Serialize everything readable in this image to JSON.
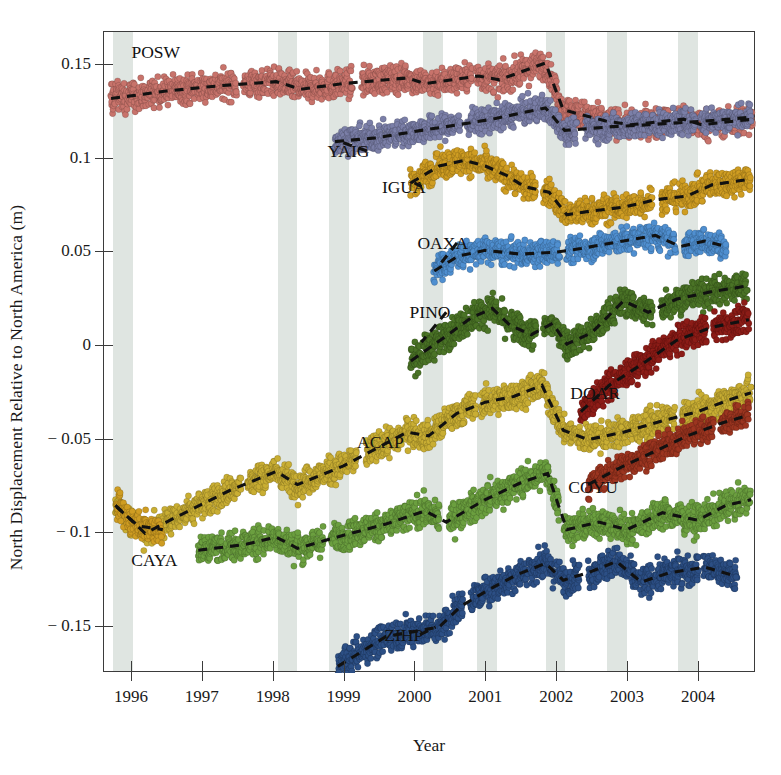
{
  "chart_data": {
    "type": "scatter",
    "title": "",
    "xlabel": "Year",
    "ylabel": "North Displacement Relative to North America (m)",
    "xlim": [
      1995.62,
      2004.82
    ],
    "ylim": [
      -0.175,
      0.167
    ],
    "grid": false,
    "legend_position": "inline-annotations",
    "xticks": [
      1996,
      1997,
      1998,
      1999,
      2000,
      2001,
      2002,
      2003,
      2004
    ],
    "xtick_labels": [
      "1996",
      "1997",
      "1998",
      "1999",
      "2000",
      "2001",
      "2002",
      "2003",
      "2004"
    ],
    "yticks": [
      0.15,
      0.1,
      0.05,
      0,
      -0.05,
      -0.1,
      -0.15
    ],
    "ytick_labels": [
      "0.15",
      "0.1",
      "0.05",
      "0",
      "− 0.05",
      "− 0.1",
      "− 0.15"
    ],
    "shaded_bands": [
      {
        "start": 1995.75,
        "end": 1996.03
      },
      {
        "start": 1998.07,
        "end": 1998.35
      },
      {
        "start": 1998.8,
        "end": 1999.08
      },
      {
        "start": 2000.12,
        "end": 2000.4
      },
      {
        "start": 2000.88,
        "end": 2001.16
      },
      {
        "start": 2001.85,
        "end": 2002.13
      },
      {
        "start": 2002.72,
        "end": 2003.0
      },
      {
        "start": 2003.72,
        "end": 2004.0
      }
    ],
    "band_color": "#d9e0dc",
    "series": [
      {
        "name": "POSW",
        "color": "#c8736b",
        "label_x": 1996.35,
        "label_y": 0.1565,
        "points_note": "dense daily scatter, gentle northward trend with slow-slip offsets",
        "trend": [
          [
            1995.72,
            0.1315
          ],
          [
            1996.5,
            0.1355
          ],
          [
            1997.3,
            0.1385
          ],
          [
            1998.05,
            0.1405
          ],
          [
            1998.4,
            0.1365
          ],
          [
            1999.0,
            0.1395
          ],
          [
            1999.9,
            0.1425
          ],
          [
            2000.15,
            0.1395
          ],
          [
            2000.9,
            0.1435
          ],
          [
            2001.2,
            0.1415
          ],
          [
            2001.85,
            0.1505
          ],
          [
            2002.1,
            0.1255
          ],
          [
            2002.7,
            0.1195
          ],
          [
            2003.05,
            0.1175
          ],
          [
            2003.8,
            0.1205
          ],
          [
            2004.05,
            0.1175
          ],
          [
            2004.78,
            0.1205
          ]
        ],
        "scatter_spread": 0.0075
      },
      {
        "name": "YAIG",
        "color": "#7b7fa8",
        "label_x": 1999.07,
        "label_y": 0.1035,
        "trend": [
          [
            1998.88,
            0.1085
          ],
          [
            1999.45,
            0.1105
          ],
          [
            2000.1,
            0.1145
          ],
          [
            2000.45,
            0.1165
          ],
          [
            2001.1,
            0.1205
          ],
          [
            2001.85,
            0.1265
          ],
          [
            2002.12,
            0.1145
          ],
          [
            2002.8,
            0.1165
          ],
          [
            2003.3,
            0.1175
          ],
          [
            2004.1,
            0.1195
          ],
          [
            2004.75,
            0.1215
          ]
        ],
        "scatter_spread": 0.0068
      },
      {
        "name": "IGUA",
        "color": "#cf9d22",
        "label_x": 1999.85,
        "label_y": 0.0845,
        "trend": [
          [
            1999.95,
            0.0865
          ],
          [
            2000.35,
            0.0955
          ],
          [
            2000.7,
            0.0985
          ],
          [
            2001.0,
            0.0955
          ],
          [
            2001.3,
            0.0905
          ],
          [
            2001.55,
            0.0845
          ],
          [
            2001.9,
            0.0815
          ],
          [
            2002.15,
            0.0695
          ],
          [
            2002.5,
            0.0715
          ],
          [
            2002.95,
            0.0735
          ],
          [
            2003.4,
            0.0775
          ],
          [
            2003.85,
            0.0795
          ],
          [
            2004.2,
            0.0855
          ],
          [
            2004.75,
            0.0885
          ]
        ],
        "scatter_spread": 0.0072
      },
      {
        "name": "OAXA",
        "color": "#4f8fd0",
        "label_x": 2000.4,
        "label_y": 0.0545,
        "trend": [
          [
            2000.28,
            0.0395
          ],
          [
            2000.62,
            0.0475
          ],
          [
            2001.0,
            0.0505
          ],
          [
            2001.5,
            0.0485
          ],
          [
            2002.0,
            0.0495
          ],
          [
            2002.35,
            0.0515
          ],
          [
            2002.95,
            0.0555
          ],
          [
            2003.4,
            0.0585
          ],
          [
            2003.75,
            0.0525
          ],
          [
            2004.1,
            0.0555
          ],
          [
            2004.4,
            0.0525
          ]
        ],
        "scatter_spread": 0.0068
      },
      {
        "name": "PINO",
        "color": "#4a7326",
        "label_x": 2000.22,
        "label_y": 0.0175,
        "trend": [
          [
            1999.95,
            -0.0085
          ],
          [
            2000.4,
            0.0035
          ],
          [
            2000.8,
            0.0145
          ],
          [
            2001.1,
            0.0195
          ],
          [
            2001.35,
            0.0105
          ],
          [
            2001.65,
            0.0055
          ],
          [
            2001.95,
            0.0115
          ],
          [
            2002.15,
            0.0005
          ],
          [
            2002.5,
            0.0065
          ],
          [
            2002.95,
            0.0235
          ],
          [
            2003.3,
            0.0175
          ],
          [
            2003.7,
            0.0245
          ],
          [
            2004.2,
            0.0285
          ],
          [
            2004.7,
            0.0315
          ]
        ],
        "scatter_spread": 0.0078
      },
      {
        "name": "DOAR",
        "color": "#8c1c17",
        "label_x": 2002.55,
        "label_y": -0.0255,
        "trend": [
          [
            2002.35,
            -0.0355
          ],
          [
            2002.75,
            -0.0215
          ],
          [
            2003.2,
            -0.0105
          ],
          [
            2003.7,
            0.0025
          ],
          [
            2004.2,
            0.0095
          ],
          [
            2004.72,
            0.0135
          ]
        ],
        "scatter_spread": 0.0075
      },
      {
        "name": "ACAP",
        "color": "#c9ae33",
        "label_x": 1999.52,
        "label_y": -0.0515,
        "trend": [
          [
            1995.78,
            -0.0855
          ],
          [
            1996.2,
            -0.1005
          ],
          [
            1996.6,
            -0.0925
          ],
          [
            1997.4,
            -0.0775
          ],
          [
            1998.05,
            -0.0675
          ],
          [
            1998.35,
            -0.0745
          ],
          [
            1999.0,
            -0.0645
          ],
          [
            1999.9,
            -0.0465
          ],
          [
            2000.2,
            -0.0485
          ],
          [
            2000.6,
            -0.0365
          ],
          [
            2001.0,
            -0.0305
          ],
          [
            2001.4,
            -0.0275
          ],
          [
            2001.8,
            -0.0215
          ],
          [
            2002.1,
            -0.0455
          ],
          [
            2002.45,
            -0.0505
          ],
          [
            2002.95,
            -0.0465
          ],
          [
            2003.5,
            -0.0405
          ],
          [
            2004.0,
            -0.0355
          ],
          [
            2004.5,
            -0.0285
          ],
          [
            2004.75,
            -0.0255
          ]
        ],
        "scatter_spread": 0.0075
      },
      {
        "name": "CAYA",
        "color": "#cf9d22",
        "label_x": 1996.33,
        "label_y": -0.1145,
        "trend": [
          [
            1995.8,
            -0.0865
          ],
          [
            1996.1,
            -0.0965
          ],
          [
            1996.45,
            -0.0985
          ]
        ],
        "scatter_spread": 0.0075
      },
      {
        "name": "COYU",
        "color": "#6b9f3f",
        "label_x": 2002.52,
        "label_y": -0.0755,
        "trend": [
          [
            1996.95,
            -0.1095
          ],
          [
            1997.6,
            -0.1065
          ],
          [
            1998.05,
            -0.1025
          ],
          [
            1998.35,
            -0.1085
          ],
          [
            1999.0,
            -0.1015
          ],
          [
            1999.6,
            -0.0955
          ],
          [
            2000.15,
            -0.0885
          ],
          [
            2000.45,
            -0.0945
          ],
          [
            2001.0,
            -0.0825
          ],
          [
            2001.5,
            -0.0735
          ],
          [
            2001.88,
            -0.0685
          ],
          [
            2002.15,
            -0.0985
          ],
          [
            2002.6,
            -0.0945
          ],
          [
            2003.0,
            -0.0985
          ],
          [
            2003.5,
            -0.0895
          ],
          [
            2004.0,
            -0.0935
          ],
          [
            2004.4,
            -0.0855
          ],
          [
            2004.75,
            -0.0825
          ]
        ],
        "scatter_spread": 0.0078
      },
      {
        "name": "ZIHP",
        "color": "#2c4f85",
        "label_x": 1999.85,
        "label_y": -0.1545,
        "trend": [
          [
            1998.92,
            -0.1715
          ],
          [
            1999.6,
            -0.1555
          ],
          [
            2000.35,
            -0.1505
          ],
          [
            2000.65,
            -0.1395
          ],
          [
            2001.05,
            -0.1305
          ],
          [
            2001.45,
            -0.1225
          ],
          [
            2001.85,
            -0.1165
          ],
          [
            2002.1,
            -0.1255
          ],
          [
            2002.45,
            -0.1215
          ],
          [
            2002.85,
            -0.1155
          ],
          [
            2003.2,
            -0.1265
          ],
          [
            2003.6,
            -0.1215
          ],
          [
            2004.1,
            -0.1185
          ],
          [
            2004.55,
            -0.1235
          ]
        ],
        "scatter_spread": 0.0078
      },
      {
        "name": "unlabeled-red-lower",
        "color": "#9c3520",
        "label_x": null,
        "label_y": null,
        "trend": [
          [
            2002.45,
            -0.0745
          ],
          [
            2002.9,
            -0.0655
          ],
          [
            2003.35,
            -0.0575
          ],
          [
            2003.85,
            -0.0485
          ],
          [
            2004.35,
            -0.0415
          ],
          [
            2004.72,
            -0.0375
          ]
        ],
        "scatter_spread": 0.0068
      }
    ],
    "trend_line_style": "dashed",
    "trend_line_color": "#111111",
    "annotation_leaders": [
      {
        "series": "YAIG",
        "from_x": 1999.33,
        "from_y": 0.1035,
        "to_x": 1998.95,
        "to_y": 0.1085
      },
      {
        "series": "IGUA",
        "from_x": 2000.1,
        "from_y": 0.0845,
        "to_x": 2000.0,
        "to_y": 0.0865
      },
      {
        "series": "OAXA",
        "from_x": 2000.6,
        "from_y": 0.0545,
        "to_x": 2000.35,
        "to_y": 0.0425
      },
      {
        "series": "PINO",
        "from_x": 2000.45,
        "from_y": 0.0175,
        "to_x": 2000.1,
        "to_y": 0.0015
      },
      {
        "series": "ZIHP",
        "from_x": 2000.08,
        "from_y": -0.1545,
        "to_x": 2000.3,
        "to_y": -0.1505
      }
    ]
  },
  "labels": {
    "xlabel": "Year",
    "ylabel": "North Displacement Relative to North America (m)"
  }
}
